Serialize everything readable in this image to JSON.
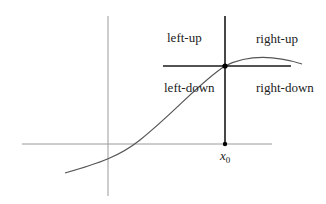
{
  "diagram": {
    "quadrant_labels": {
      "left_up": "left-up",
      "right_up": "right-up",
      "left_down": "left-down",
      "right_down": "right-down"
    },
    "x_marker": {
      "symbol": "x",
      "subscript": "0"
    },
    "colors": {
      "axes": "#9a9a9a",
      "crosshair": "#1a1a1a",
      "curve": "#555555",
      "point": "#000000"
    }
  }
}
